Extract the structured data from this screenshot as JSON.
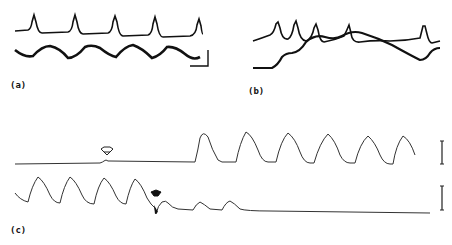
{
  "figure": {
    "panels": [
      {
        "id": "a",
        "label": "(a)",
        "traces": 2,
        "description": "Top: periodic sharp spikes (5 peaks); bottom: smooth sinusoidal oscillation; scale bar at lower right"
      },
      {
        "id": "b",
        "label": "(b)",
        "traces": 2,
        "description": "Two overlapping traces: spike train and slow drifting wave that cross each other"
      },
      {
        "id": "c",
        "label": "(c)",
        "traces": 2,
        "description": "Top: flat baseline, open arrow marks stimulus, then large periodic waves start; bottom: periodic waves stop after filled arrow stimulus, decaying to flat baseline; vertical scale bars at right"
      }
    ],
    "markers": {
      "open_arrow": "open-arrow-icon",
      "filled_arrow": "filled-arrow-icon"
    },
    "colors": {
      "trace": "#111111",
      "background": "#ffffff"
    }
  }
}
